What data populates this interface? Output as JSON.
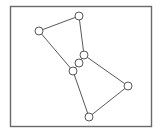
{
  "figure": {
    "title": "",
    "background_color": "#ffffff",
    "frame": {
      "name": "plot-border",
      "x": 10.5,
      "y": 6.5,
      "width": 141,
      "height": 120,
      "stroke_color": "#6a6a6a",
      "fill": "none"
    }
  },
  "chart_data": {
    "type": "scatter",
    "title": "",
    "xlabel": "",
    "ylabel": "",
    "grid": false,
    "legend": null,
    "xlim": [
      10,
      152
    ],
    "ylim": [
      6,
      127
    ],
    "node_style": {
      "radius": 4,
      "fill_color": "#ffffff",
      "stroke_color": "#585858"
    },
    "edge_style": {
      "stroke_color": "#585858",
      "stroke_width": 1
    },
    "nodes": [
      {
        "id": "n1",
        "label": "",
        "x": 39,
        "y": 31
      },
      {
        "id": "n2",
        "label": "",
        "x": 79,
        "y": 16
      },
      {
        "id": "n3",
        "label": "",
        "x": 84,
        "y": 55
      },
      {
        "id": "n4",
        "label": "",
        "x": 79,
        "y": 63
      },
      {
        "id": "n5",
        "label": "",
        "x": 73,
        "y": 71
      },
      {
        "id": "n6",
        "label": "",
        "x": 128,
        "y": 86
      },
      {
        "id": "n7",
        "label": "",
        "x": 89,
        "y": 117
      }
    ],
    "edges": [
      {
        "source": "n1",
        "target": "n2"
      },
      {
        "source": "n1",
        "target": "n5"
      },
      {
        "source": "n2",
        "target": "n3"
      },
      {
        "source": "n3",
        "target": "n4"
      },
      {
        "source": "n4",
        "target": "n5"
      },
      {
        "source": "n3",
        "target": "n6"
      },
      {
        "source": "n5",
        "target": "n7"
      },
      {
        "source": "n6",
        "target": "n7"
      }
    ]
  }
}
